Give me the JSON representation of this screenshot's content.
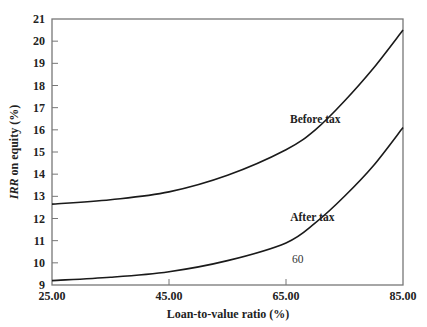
{
  "chart_data": {
    "type": "line",
    "title": "",
    "xlabel": "Loan-to-value ratio (%)",
    "ylabel_italic": "IRR",
    "ylabel_rest": " on equity (%)",
    "ylabel": "IRR on equity (%)",
    "xlim": [
      25,
      85
    ],
    "ylim": [
      9,
      21
    ],
    "x_ticks": [
      "25.00",
      "45.00",
      "65.00",
      "85.00"
    ],
    "x_tick_values": [
      25,
      45,
      65,
      85
    ],
    "y_ticks": [
      "9",
      "10",
      "11",
      "12",
      "13",
      "14",
      "15",
      "16",
      "17",
      "18",
      "19",
      "20",
      "21"
    ],
    "y_tick_values": [
      9,
      10,
      11,
      12,
      13,
      14,
      15,
      16,
      17,
      18,
      19,
      20,
      21
    ],
    "grid": false,
    "legend": "none (inline curve labels)",
    "x": [
      25,
      35,
      45,
      55,
      65,
      70,
      75,
      80,
      85
    ],
    "series": [
      {
        "name": "Before tax",
        "values": [
          12.65,
          12.85,
          13.2,
          13.95,
          15.1,
          16.0,
          17.3,
          18.8,
          20.5
        ]
      },
      {
        "name": "After tax",
        "values": [
          9.2,
          9.35,
          9.6,
          10.1,
          10.9,
          11.8,
          13.0,
          14.4,
          16.1
        ]
      }
    ],
    "annotations": [
      {
        "text": "Before tax",
        "x": 70,
        "y": 16.3
      },
      {
        "text": "After tax",
        "x": 69.5,
        "y": 11.9
      },
      {
        "text": "60",
        "x": 67,
        "y": 10.0
      }
    ]
  }
}
